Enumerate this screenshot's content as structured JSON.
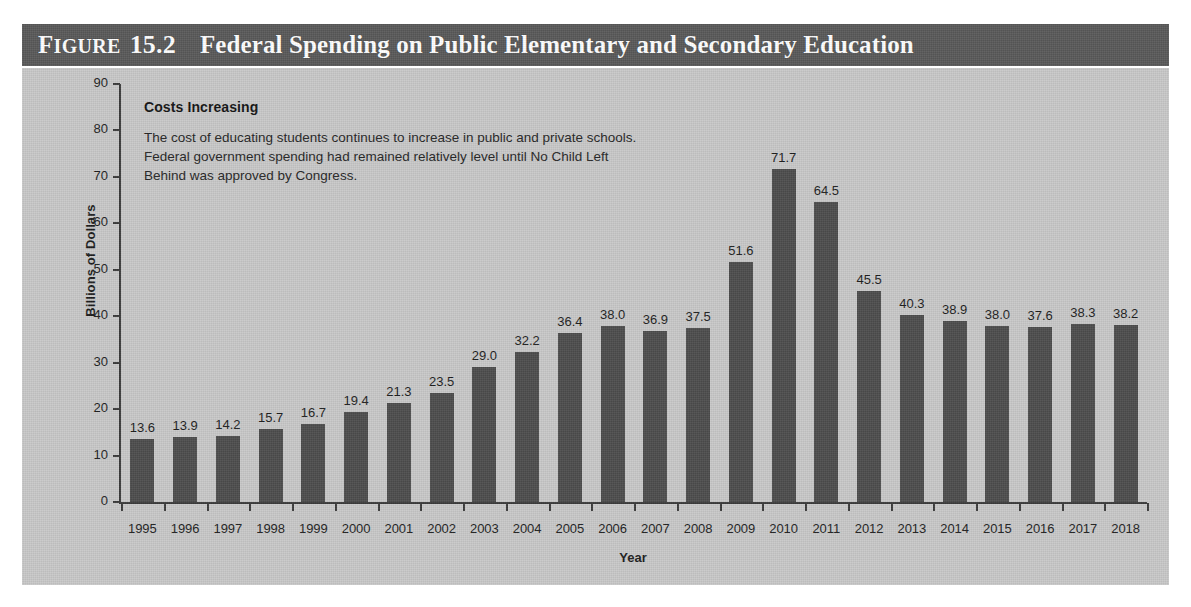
{
  "header": {
    "figure_word": "Figure",
    "figure_number": "15.2",
    "title": "Federal Spending on Public Elementary and Secondary Education",
    "band_color": "#595959",
    "text_color": "#ffffff"
  },
  "annotation": {
    "heading": "Costs Increasing",
    "line1": "The cost of educating students continues to increase in public and private schools.",
    "line2": "Federal government spending had remained relatively level until No Child Left",
    "line3": "Behind was approved by Congress."
  },
  "chart_data": {
    "type": "bar",
    "title": "Federal Spending on Public Elementary and Secondary Education",
    "xlabel": "Year",
    "ylabel": "Billions of Dollars",
    "ylim": [
      0,
      90
    ],
    "ytick_step": 10,
    "yticks": [
      90,
      80,
      70,
      60,
      50,
      40,
      30,
      20,
      10,
      0
    ],
    "grid": false,
    "legend": "none",
    "bar_color": "#4d4d4d",
    "plot_background": "#c9c9c9",
    "data_labels": true,
    "categories": [
      "1995",
      "1996",
      "1997",
      "1998",
      "1999",
      "2000",
      "2001",
      "2002",
      "2003",
      "2004",
      "2005",
      "2006",
      "2007",
      "2008",
      "2009",
      "2010",
      "2011",
      "2012",
      "2013",
      "2014",
      "2015",
      "2016",
      "2017",
      "2018"
    ],
    "values": [
      13.6,
      13.9,
      14.2,
      15.7,
      16.7,
      19.4,
      21.3,
      23.5,
      29.0,
      32.2,
      36.4,
      38.0,
      36.9,
      37.5,
      51.6,
      71.7,
      64.5,
      45.5,
      40.3,
      38.9,
      38.0,
      37.6,
      38.3,
      38.2
    ],
    "value_labels": [
      "13.6",
      "13.9",
      "14.2",
      "15.7",
      "16.7",
      "19.4",
      "21.3",
      "23.5",
      "29.0",
      "32.2",
      "36.4",
      "38.0",
      "36.9",
      "37.5",
      "51.6",
      "71.7",
      "64.5",
      "45.5",
      "40.3",
      "38.9",
      "38.0",
      "37.6",
      "38.3",
      "38.2"
    ],
    "annotation_heading": "Costs Increasing",
    "annotation_text": "The cost of educating students continues to increase in public and private schools. Federal government spending had remained relatively level until No Child Left Behind was approved by Congress."
  }
}
